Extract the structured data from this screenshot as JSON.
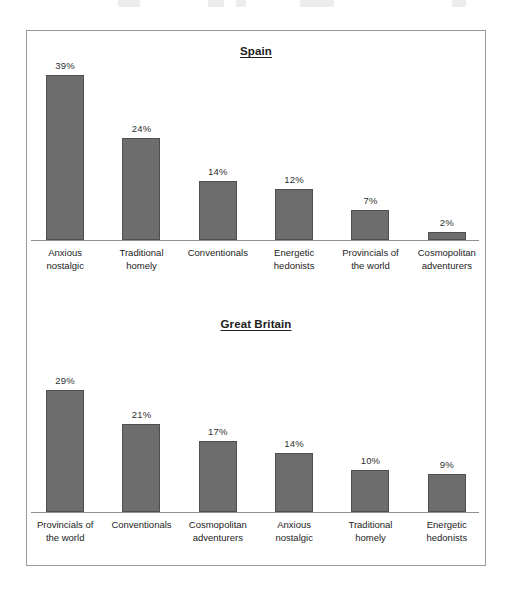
{
  "figure": {
    "border_color": "#9a9a9a",
    "bar_fill": "#6d6d6d",
    "bar_stroke": "#4f4f4f",
    "axis_color": "#8e8e8e"
  },
  "chart_data": [
    {
      "type": "bar",
      "title": "Spain",
      "xlabel": "",
      "ylabel": "",
      "ylim": [
        0,
        42
      ],
      "grid": false,
      "legend": "none",
      "value_labels": true,
      "categories": [
        "Anxious nostalgic",
        "Traditional homely",
        "Conventionals",
        "Energetic hedonists",
        "Provincials of the world",
        "Cosmopolitan adventurers"
      ],
      "category_lines": [
        [
          "Anxious",
          "nostalgic"
        ],
        [
          "Traditional",
          "homely"
        ],
        [
          "Conventionals",
          ""
        ],
        [
          "Energetic",
          "hedonists"
        ],
        [
          "Provincials of",
          "the world"
        ],
        [
          "Cosmopolitan",
          "adventurers"
        ]
      ],
      "values": [
        39,
        24,
        14,
        12,
        7,
        2
      ],
      "value_text": [
        "39%",
        "24%",
        "14%",
        "12%",
        "7%",
        "2%"
      ]
    },
    {
      "type": "bar",
      "title": "Great Britain",
      "xlabel": "",
      "ylabel": "",
      "ylim": [
        0,
        42
      ],
      "grid": false,
      "legend": "none",
      "value_labels": true,
      "categories": [
        "Provincials of the world",
        "Conventionals",
        "Cosmopolitan adventurers",
        "Anxious nostalgic",
        "Traditional homely",
        "Energetic hedonists"
      ],
      "category_lines": [
        [
          "Provincials of",
          "the world"
        ],
        [
          "Conventionals",
          ""
        ],
        [
          "Cosmopolitan",
          "adventurers"
        ],
        [
          "Anxious",
          "nostalgic"
        ],
        [
          "Traditional",
          "homely"
        ],
        [
          "Energetic",
          "hedonists"
        ]
      ],
      "values": [
        29,
        21,
        17,
        14,
        10,
        9
      ],
      "value_text": [
        "29%",
        "21%",
        "17%",
        "14%",
        "10%",
        "9%"
      ]
    }
  ]
}
